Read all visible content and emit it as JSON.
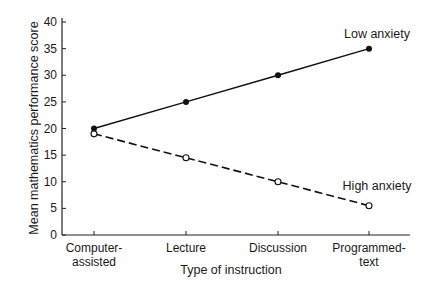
{
  "chart_data": {
    "type": "line",
    "title": "",
    "xlabel": "Type of instruction",
    "ylabel": "Mean mathematics performance score",
    "categories": [
      [
        "Computer-",
        "assisted"
      ],
      [
        "Lecture"
      ],
      [
        "Discussion"
      ],
      [
        "Programmed-",
        "text"
      ]
    ],
    "category_names": [
      "Computer-assisted",
      "Lecture",
      "Discussion",
      "Programmed-text"
    ],
    "ylim": [
      0,
      40
    ],
    "yticks": [
      0,
      5,
      10,
      15,
      20,
      25,
      30,
      35,
      40
    ],
    "grid": false,
    "legend": "inline labels at line ends",
    "series": [
      {
        "name": "Low anxiety",
        "values": [
          20,
          25,
          30,
          35
        ],
        "line_style": "solid",
        "marker": "filled-circle",
        "color": "#111111"
      },
      {
        "name": "High anxiety",
        "values": [
          19,
          14.5,
          10,
          5.5
        ],
        "line_style": "dashed",
        "marker": "open-circle",
        "color": "#111111"
      }
    ]
  }
}
